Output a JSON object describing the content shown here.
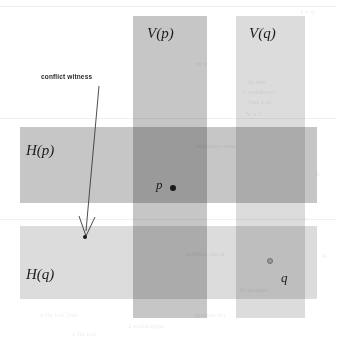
{
  "figure": {
    "background_color": "#ffffff"
  },
  "annotation": {
    "label": "conflict witness",
    "arrow": "leader-arrow",
    "witness_point": "witness-dot"
  },
  "regions": [
    {
      "id": "v-p",
      "label": "V(p)",
      "orientation": "vertical",
      "color": "#c6c6c6",
      "x": 133,
      "y": 16,
      "width": 74,
      "height": 302,
      "label_x": 147,
      "label_y": 26
    },
    {
      "id": "v-q",
      "label": "V(q)",
      "orientation": "vertical",
      "color": "#dcdcdc",
      "x": 236,
      "y": 16,
      "width": 69,
      "height": 302,
      "label_x": 249,
      "label_y": 26
    },
    {
      "id": "h-p",
      "label": "H(p)",
      "orientation": "horizontal",
      "color": "#c6c6c6",
      "x": 20,
      "y": 127,
      "width": 297,
      "height": 76,
      "label_x": 26,
      "label_y": 143
    },
    {
      "id": "h-q",
      "label": "H(q)",
      "orientation": "horizontal",
      "color": "#dcdcdc",
      "x": 20,
      "y": 226,
      "width": 297,
      "height": 73,
      "label_x": 26,
      "label_y": 267
    }
  ],
  "points": [
    {
      "id": "p",
      "label": "p",
      "style": "filled",
      "x": 173,
      "y": 188,
      "radius": 3.2,
      "label_x": 156,
      "label_y": 178
    },
    {
      "id": "q",
      "label": "q",
      "style": "ring",
      "x": 270,
      "y": 261,
      "radius": 3.4,
      "label_x": 281,
      "label_y": 271
    },
    {
      "id": "witness",
      "label": "",
      "style": "filled-small",
      "x": 85,
      "y": 237,
      "radius": 2.2,
      "label_x": 0,
      "label_y": 0
    }
  ],
  "callout": {
    "text_x": 41,
    "text_y": 74
  },
  "bleed_text": [
    {
      "text": "1 =  q",
      "x": 300,
      "y": 8,
      "size": 7
    },
    {
      "text": "m o",
      "x": 196,
      "y": 60,
      "size": 7
    },
    {
      "text": "sy bns",
      "x": 248,
      "y": 78,
      "size": 7
    },
    {
      "text": "o noitibnoo",
      "x": 243,
      "y": 88,
      "size": 7
    },
    {
      "text": "bns 1 nl",
      "x": 249,
      "y": 98,
      "size": 7
    },
    {
      "text": "V  o 1",
      "x": 246,
      "y": 110,
      "size": 7
    },
    {
      "text": "noitibnoo  esac",
      "x": 196,
      "y": 142,
      "size": 7
    },
    {
      "text": "A",
      "x": 315,
      "y": 170,
      "size": 7
    },
    {
      "text": "o",
      "x": 304,
      "y": 214,
      "size": 7
    },
    {
      "text": "toilfnoc  eht  si",
      "x": 186,
      "y": 250,
      "size": 7
    },
    {
      "text": "A",
      "x": 322,
      "y": 252,
      "size": 7
    },
    {
      "text": "lo snoiger",
      "x": 240,
      "y": 286,
      "size": 7
    },
    {
      "text": "q  lla  1o1  ,bns",
      "x": 40,
      "y": 311,
      "size": 7
    },
    {
      "text": "2 noitacilppa",
      "x": 128,
      "y": 322,
      "size": 7
    },
    {
      "text": "mroinu  eht",
      "x": 195,
      "y": 311,
      "size": 7
    },
    {
      "text": "q lla 1o1",
      "x": 72,
      "y": 330,
      "size": 7
    }
  ]
}
